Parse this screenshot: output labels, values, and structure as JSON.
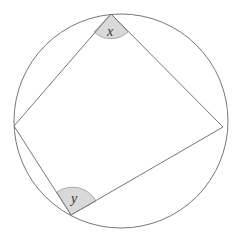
{
  "diagram": {
    "type": "cyclic-quadrilateral",
    "circle": {
      "cx": 121,
      "cy": 121,
      "r": 107,
      "stroke": "#777777"
    },
    "vertices": {
      "top": {
        "x": 111,
        "y": 14
      },
      "right": {
        "x": 223,
        "y": 127
      },
      "bottom_left": {
        "x": 71,
        "y": 215
      },
      "left": {
        "x": 14,
        "y": 126
      }
    },
    "edge_color": "#777777",
    "angle_fill": "#d9d9d9",
    "angles": [
      {
        "name": "x",
        "label": "x",
        "vertex": "top",
        "label_x": 110,
        "label_y": 36
      },
      {
        "name": "y",
        "label": "y",
        "vertex": "bottom_left",
        "label_x": 73,
        "label_y": 203
      }
    ]
  }
}
